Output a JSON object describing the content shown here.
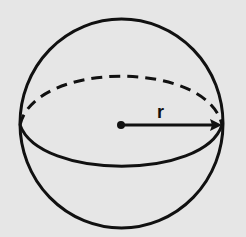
{
  "diagram": {
    "radius_label": "r",
    "colors": {
      "background": "#e6e6e6",
      "stroke": "#111111"
    }
  }
}
